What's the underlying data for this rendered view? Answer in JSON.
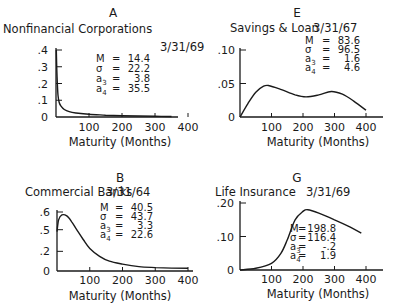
{
  "chart_data": [
    {
      "panel": "A",
      "type": "line",
      "title": "Nonfinancial Corporations",
      "date": "3/31/69",
      "xlabel": "Maturity (Months)",
      "ylabel": "",
      "x_ticks": [
        "100",
        "200",
        "300",
        "400"
      ],
      "y_ticks": [
        ".4",
        ".3",
        ".2",
        ".1",
        "0"
      ],
      "xlim": [
        0,
        400
      ],
      "ylim": [
        0,
        0.4
      ],
      "stats": {
        "M": "14.4",
        "sigma": "22.2",
        "a3": "3.8",
        "a4": "35.5"
      },
      "x": [
        1,
        3,
        6,
        10,
        15,
        25,
        40,
        60,
        100,
        150,
        200,
        250,
        300,
        350
      ],
      "values": [
        0.4,
        0.25,
        0.13,
        0.085,
        0.065,
        0.045,
        0.032,
        0.024,
        0.016,
        0.011,
        0.008,
        0.006,
        0.004,
        0.003
      ]
    },
    {
      "panel": "E",
      "type": "line",
      "title": "Savings & Loan",
      "date": "3/31/67",
      "xlabel": "Maturity (Months)",
      "ylabel": "",
      "x_ticks": [
        "100",
        "200",
        "300",
        "400"
      ],
      "y_ticks": [
        ".10",
        ".05",
        "0"
      ],
      "xlim": [
        0,
        400
      ],
      "ylim": [
        0,
        0.1
      ],
      "stats": {
        "M": "83.6",
        "sigma": "96.5",
        "a3": "1.6",
        "a4": "4.6"
      },
      "x": [
        0,
        25,
        50,
        75,
        90,
        125,
        175,
        210,
        250,
        290,
        325,
        360,
        400
      ],
      "values": [
        0,
        0.02,
        0.037,
        0.046,
        0.047,
        0.042,
        0.033,
        0.03,
        0.033,
        0.038,
        0.034,
        0.024,
        0.01
      ]
    },
    {
      "panel": "B",
      "type": "line",
      "title": "Commercial Banks",
      "date": "3/31/64",
      "xlabel": "Maturity (Months)",
      "ylabel": "",
      "x_ticks": [
        "100",
        "200",
        "300",
        "400"
      ],
      "y_ticks": [
        ".6",
        ".5",
        ".2",
        "0"
      ],
      "xlim": [
        0,
        400
      ],
      "ylim": [
        0,
        0.6
      ],
      "stats": {
        "M": "40.5",
        "sigma": "43.7",
        "a3": "3.3",
        "a4": "22.6"
      },
      "x": [
        0,
        5,
        15,
        30,
        45,
        60,
        80,
        100,
        130,
        160,
        200,
        250,
        300,
        350,
        400
      ],
      "values": [
        0.4,
        0.52,
        0.57,
        0.56,
        0.5,
        0.42,
        0.32,
        0.23,
        0.15,
        0.1,
        0.07,
        0.045,
        0.035,
        0.03,
        0.028
      ]
    },
    {
      "panel": "G",
      "type": "line",
      "title": "Life Insurance",
      "date": "3/31/69",
      "xlabel": "Maturity (Months)",
      "ylabel": "",
      "x_ticks": [
        "100",
        "200",
        "300",
        "400"
      ],
      "y_ticks": [
        ".20",
        ".10",
        "0"
      ],
      "xlim": [
        0,
        400
      ],
      "ylim": [
        0,
        0.2
      ],
      "stats": {
        "M": "198.8",
        "sigma": "116.4",
        "a3": "-.2",
        "a4": "1.9"
      },
      "x": [
        0,
        50,
        100,
        130,
        150,
        175,
        200,
        215,
        250,
        300,
        350,
        385
      ],
      "values": [
        0,
        0.005,
        0.02,
        0.05,
        0.09,
        0.15,
        0.175,
        0.18,
        0.17,
        0.15,
        0.128,
        0.11
      ]
    }
  ],
  "labels": {
    "stat_m": "M",
    "stat_sigma": "σ",
    "stat_a": "a",
    "eq": "="
  }
}
